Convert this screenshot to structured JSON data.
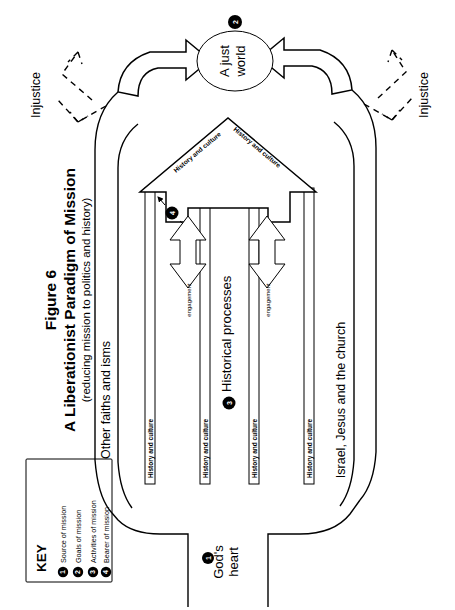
{
  "figure": {
    "number_label": "Figure 6",
    "title": "A Liberationist Paradigm of Mission",
    "subtitle": "(reducing mission to politics and history)"
  },
  "key_box": {
    "heading": "KEY",
    "items": [
      {
        "badge": "1",
        "label": "Source of mission"
      },
      {
        "badge": "2",
        "label": "Goals of mission"
      },
      {
        "badge": "3",
        "label": "Activities of mission"
      },
      {
        "badge": "4",
        "label": "Bearer of mission"
      }
    ]
  },
  "nodes": {
    "source": {
      "badge": "1",
      "label_line1": "God's",
      "label_line2": "heart"
    },
    "goal": {
      "badge": "2",
      "label_line1": "A just",
      "label_line2": "world"
    },
    "activities": {
      "badge": "3",
      "label": "Historical processes"
    },
    "bearer": {
      "badge": "4",
      "label": ""
    }
  },
  "labels": {
    "other_faiths": "Other faiths and isms",
    "israel_church": "Israel, Jesus and the church",
    "injustice_left": "Injustice",
    "injustice_right": "Injustice",
    "history_culture_arrow_left": "History and culture",
    "history_culture_arrow_right": "History and culture",
    "history_culture_band_outer_left": "History and culture",
    "history_culture_band_inner_left": "History and culture",
    "history_culture_band_inner_right": "History and culture",
    "history_culture_band_outer_right": "History and culture",
    "engagement_left": "engagement",
    "engagement_right": "engagement"
  },
  "colors": {
    "ink": "#000000",
    "paper": "#ffffff"
  }
}
